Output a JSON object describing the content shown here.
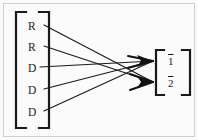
{
  "figure": {
    "type": "bipartite-mapping-diagram",
    "background_color": "#fbfbfb",
    "ink_color": "#1a1a1a",
    "frame_color": "#c8c8c8"
  },
  "outer_frame": {
    "name": "outer-border"
  },
  "source_set": {
    "bracket": {
      "open": "[",
      "close": "]"
    },
    "items": [
      {
        "index": 0,
        "label": "R",
        "x": 30,
        "y": 27
      },
      {
        "index": 1,
        "label": "R",
        "x": 30,
        "y": 48
      },
      {
        "index": 2,
        "label": "D",
        "x": 30,
        "y": 69
      },
      {
        "index": 3,
        "label": "D",
        "x": 30,
        "y": 90
      },
      {
        "index": 4,
        "label": "D",
        "x": 30,
        "y": 113
      }
    ]
  },
  "target_set": {
    "bracket": {
      "open": "[",
      "close": "]"
    },
    "items": [
      {
        "index": 0,
        "label": "1",
        "overline": true,
        "x": 169,
        "y": 63
      },
      {
        "index": 1,
        "label": "2",
        "overline": true,
        "x": 169,
        "y": 85
      }
    ]
  },
  "edges": [
    {
      "from": "R",
      "from_index": 0,
      "to": "2",
      "to_index": 1,
      "x1": 44,
      "y1": 25,
      "x2": 156,
      "y2": 82
    },
    {
      "from": "R",
      "from_index": 1,
      "to": "2",
      "to_index": 1,
      "x1": 44,
      "y1": 46,
      "x2": 156,
      "y2": 82
    },
    {
      "from": "D",
      "from_index": 2,
      "to": "1",
      "to_index": 0,
      "x1": 40,
      "y1": 67,
      "x2": 156,
      "y2": 61
    },
    {
      "from": "D",
      "from_index": 3,
      "to": "1",
      "to_index": 0,
      "x1": 44,
      "y1": 89,
      "x2": 156,
      "y2": 61
    },
    {
      "from": "D",
      "from_index": 4,
      "to": "1",
      "to_index": 0,
      "x1": 44,
      "y1": 111,
      "x2": 156,
      "y2": 61
    }
  ],
  "arrowheads": [
    {
      "target": "1",
      "x": 156,
      "y": 61
    },
    {
      "target": "2",
      "x": 156,
      "y": 82
    }
  ]
}
